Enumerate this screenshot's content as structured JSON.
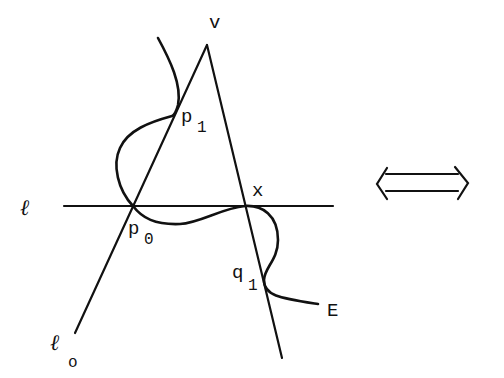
{
  "figure": {
    "labels": {
      "v": "v",
      "p1_main": "p",
      "p1_sub": "1",
      "p0_main": "p",
      "p0_sub": "0",
      "x": "x",
      "q1_main": "q",
      "q1_sub": "1",
      "E": "E",
      "ell": "ℓ",
      "ell0_main": "ℓ",
      "ell0_sub": "o"
    },
    "symbols": {
      "equivalence_arrow": "iff-arrow"
    },
    "points": {
      "v": [
        207,
        45
      ],
      "p1": [
        175,
        115
      ],
      "p0": [
        133,
        206
      ],
      "x": [
        245,
        206
      ],
      "q1": [
        265,
        282
      ]
    },
    "colors": {
      "stroke": "#111111",
      "background": "#ffffff"
    }
  }
}
